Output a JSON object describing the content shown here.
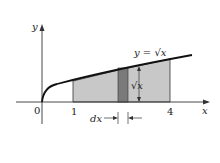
{
  "figure": {
    "axis_x_label": "x",
    "axis_y_label": "y",
    "origin_label": "0",
    "tick_1_label": "1",
    "tick_4_label": "4",
    "curve_label": "y = √x",
    "strip_height_label": "√x",
    "strip_width_label": "dx",
    "colors": {
      "region": "#c8c8c8",
      "strip": "#7a7a7a",
      "curve": "#111111",
      "axis": "#333333"
    }
  }
}
